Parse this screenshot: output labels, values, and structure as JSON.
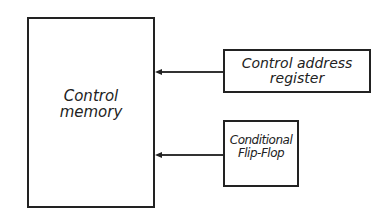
{
  "diagram": {
    "control_memory": {
      "line1": "Control",
      "line2": "memory"
    },
    "control_address_register": {
      "line1": "Control address",
      "line2": "register"
    },
    "conditional_flip_flop": {
      "line1": "Conditional",
      "line2": "Flip-Flop"
    }
  },
  "colors": {
    "stroke": "#222222",
    "background": "#ffffff"
  }
}
